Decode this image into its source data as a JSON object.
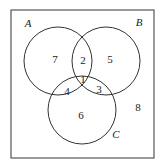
{
  "diagram": {
    "type": "venn-3",
    "sets": [
      {
        "id": "A",
        "label": "A"
      },
      {
        "id": "B",
        "label": "B"
      },
      {
        "id": "C",
        "label": "C"
      }
    ],
    "regions": {
      "A_only": "7",
      "A_and_B_only": "2",
      "B_only": "5",
      "A_and_B_and_C": "1",
      "A_and_C_only": "4",
      "B_and_C_only": "3",
      "C_only": "6",
      "outside": "8"
    }
  }
}
